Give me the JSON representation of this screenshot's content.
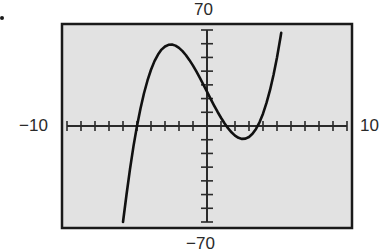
{
  "chart_data": {
    "type": "line",
    "title": "",
    "xlabel": "",
    "ylabel": "",
    "xlim": [
      -10,
      10
    ],
    "ylim": [
      -70,
      70
    ],
    "x_tick_step": 1,
    "y_tick_step": 10,
    "grid": false,
    "legend": null,
    "window_labels": {
      "xmin": "−10",
      "xmax": "10",
      "ymin": "−70",
      "ymax": "70"
    },
    "series": [
      {
        "name": "y = x^3 - 20x + 25 (approx.)",
        "x": [
          -6.0,
          -5.75,
          -5.5,
          -5.25,
          -5.0,
          -4.75,
          -4.5,
          -4.25,
          -4.0,
          -3.75,
          -3.5,
          -3.25,
          -3.0,
          -2.75,
          -2.5,
          -2.25,
          -2.0,
          -1.75,
          -1.5,
          -1.25,
          -1.0,
          -0.75,
          -0.5,
          -0.25,
          0.0,
          0.25,
          0.5,
          0.75,
          1.0,
          1.25,
          1.5,
          1.75,
          2.0,
          2.25,
          2.5,
          2.75,
          3.0,
          3.25,
          3.5,
          3.75,
          4.0,
          4.25,
          4.5,
          4.75,
          5.0,
          5.25,
          5.3
        ],
        "y": [
          -71.0,
          -50.1,
          -31.4,
          -14.7,
          0.0,
          12.8,
          23.9,
          33.2,
          41.0,
          47.3,
          52.1,
          55.7,
          58.0,
          59.2,
          59.4,
          58.6,
          57.0,
          54.6,
          51.6,
          48.0,
          44.0,
          39.6,
          34.9,
          30.0,
          25.0,
          20.0,
          15.1,
          10.4,
          6.0,
          2.0,
          -1.6,
          -4.6,
          -7.0,
          -8.6,
          -9.4,
          -9.2,
          -8.0,
          -5.7,
          -2.1,
          2.7,
          9.0,
          16.8,
          26.1,
          37.2,
          50.0,
          64.7,
          67.9
        ]
      }
    ],
    "annotations": []
  },
  "style": {
    "plot_bg": "#e2e2e2",
    "frame_color": "#1a1a1a",
    "axis_color": "#2a2a2a",
    "curve_color": "#111111"
  }
}
